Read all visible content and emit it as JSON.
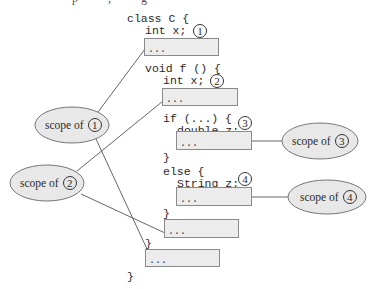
{
  "title_fragment": "p          ,          g",
  "code": {
    "lines": [
      {
        "text": "class C {",
        "x": 127,
        "y": 13
      },
      {
        "text": "int x;",
        "x": 145,
        "y": 25,
        "marker": "1"
      },
      {
        "text": "void f () {",
        "x": 145,
        "y": 63
      },
      {
        "text": "int x;",
        "x": 163,
        "y": 75,
        "marker": "2"
      },
      {
        "text": "if (...) {",
        "x": 163,
        "y": 113
      },
      {
        "text": "double z;",
        "x": 177,
        "y": 125,
        "marker": "3"
      },
      {
        "text": "}",
        "x": 163,
        "y": 152
      },
      {
        "text": "else {",
        "x": 163,
        "y": 166
      },
      {
        "text": "String z;",
        "x": 177,
        "y": 178,
        "marker": "4"
      },
      {
        "text": "}",
        "x": 163,
        "y": 208
      },
      {
        "text": "}",
        "x": 145,
        "y": 238
      },
      {
        "text": "}",
        "x": 127,
        "y": 271
      }
    ],
    "blocks": [
      {
        "id": "box-1",
        "text": "...",
        "x": 144,
        "y": 38,
        "w": 75,
        "h": 18
      },
      {
        "id": "box-2",
        "text": "...",
        "x": 162,
        "y": 88,
        "w": 76,
        "h": 18
      },
      {
        "id": "box-3",
        "text": "...",
        "x": 176,
        "y": 131,
        "w": 76,
        "h": 19
      },
      {
        "id": "box-4",
        "text": "...",
        "x": 176,
        "y": 187,
        "w": 76,
        "h": 19
      },
      {
        "id": "box-5",
        "text": "...",
        "x": 164,
        "y": 219,
        "w": 75,
        "h": 19
      },
      {
        "id": "box-6",
        "text": "...",
        "x": 145,
        "y": 249,
        "w": 75,
        "h": 18
      }
    ]
  },
  "scopes": [
    {
      "label": "scope of",
      "marker": "1",
      "cx": 72,
      "cy": 125,
      "rx": 37,
      "ry": 18
    },
    {
      "label": "scope of",
      "marker": "2",
      "cx": 47,
      "cy": 183,
      "rx": 37,
      "ry": 18
    },
    {
      "label": "scope of",
      "marker": "3",
      "cx": 320,
      "cy": 141,
      "rx": 38,
      "ry": 18
    },
    {
      "label": "scope of",
      "marker": "4",
      "cx": 327,
      "cy": 197,
      "rx": 39,
      "ry": 17
    }
  ],
  "colors": {
    "ellipse_fill": "#e8e8e8",
    "ellipse_stroke": "#777777",
    "line": "#666666",
    "box_fill": "#ececec"
  }
}
